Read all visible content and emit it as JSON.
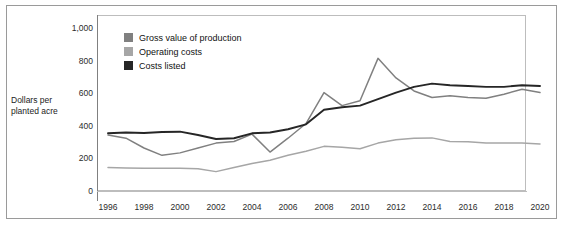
{
  "axis_title": "Dollars per\nplanted acre",
  "axis_title_line1": "Dollars per",
  "axis_title_line2": "planted acre",
  "legend": {
    "items": [
      {
        "label": "Gross value of production",
        "color": "#808080",
        "swatch_name": "legend-swatch-gross-value"
      },
      {
        "label": "Operating costs",
        "color": "#a6a6a6",
        "swatch_name": "legend-swatch-operating-costs"
      },
      {
        "label": "Costs listed",
        "color": "#262626",
        "swatch_name": "legend-swatch-costs-listed"
      }
    ]
  },
  "chart_data": {
    "type": "line",
    "title": "",
    "xlabel": "",
    "ylabel": "Dollars per planted acre",
    "xlim": [
      1996,
      2020
    ],
    "ylim": [
      0,
      1000
    ],
    "ytick_labels": [
      "1,000",
      "800",
      "600",
      "400",
      "200",
      "0"
    ],
    "ytick_values": [
      1000,
      800,
      600,
      400,
      200,
      0
    ],
    "xtick_labels": [
      "1996",
      "1998",
      "2000",
      "2002",
      "2004",
      "2006",
      "2008",
      "2010",
      "2012",
      "2014",
      "2016",
      "2018",
      "2020"
    ],
    "xtick_values": [
      1996,
      1998,
      2000,
      2002,
      2004,
      2006,
      2008,
      2010,
      2012,
      2014,
      2016,
      2018,
      2020
    ],
    "grid": false,
    "legend_position": "upper-left-inside",
    "x": [
      1996,
      1997,
      1998,
      1999,
      2000,
      2001,
      2002,
      2003,
      2004,
      2005,
      2006,
      2007,
      2008,
      2009,
      2010,
      2011,
      2012,
      2013,
      2014,
      2015,
      2016,
      2017,
      2018,
      2019,
      2020
    ],
    "series": [
      {
        "name": "Gross value of production",
        "color": "#808080",
        "values": [
          350,
          330,
          270,
          225,
          240,
          270,
          300,
          310,
          355,
          245,
          330,
          420,
          610,
          530,
          560,
          820,
          700,
          620,
          580,
          590,
          580,
          575,
          600,
          630,
          610
        ]
      },
      {
        "name": "Operating costs",
        "color": "#a6a6a6",
        "values": [
          150,
          148,
          146,
          146,
          145,
          143,
          125,
          150,
          175,
          195,
          225,
          250,
          280,
          275,
          265,
          300,
          320,
          330,
          332,
          310,
          308,
          300,
          300,
          300,
          295
        ]
      },
      {
        "name": "Costs listed",
        "color": "#262626",
        "values": [
          360,
          365,
          362,
          368,
          370,
          350,
          325,
          330,
          360,
          365,
          385,
          415,
          505,
          520,
          530,
          570,
          610,
          645,
          665,
          655,
          650,
          645,
          645,
          655,
          650
        ]
      }
    ]
  }
}
